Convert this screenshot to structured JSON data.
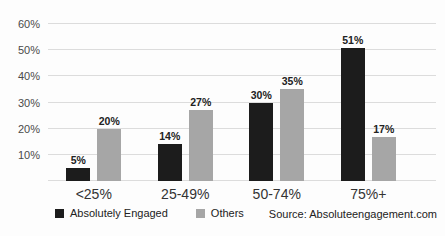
{
  "chart_data": {
    "type": "bar",
    "title": "",
    "categories": [
      "<25%",
      "25-49%",
      "50-74%",
      "75%+"
    ],
    "series": [
      {
        "name": "Absolutely Engaged",
        "color": "#1c1c1c",
        "values": [
          5,
          14,
          30,
          51
        ]
      },
      {
        "name": "Others",
        "color": "#a6a6a6",
        "values": [
          20,
          27,
          35,
          17
        ]
      }
    ],
    "value_labels": [
      [
        "5%",
        "14%",
        "30%",
        "51%"
      ],
      [
        "20%",
        "27%",
        "35%",
        "17%"
      ]
    ],
    "y_ticks": [
      10,
      20,
      30,
      40,
      50,
      60
    ],
    "y_tick_labels": [
      "10%",
      "20%",
      "30%",
      "40%",
      "50%",
      "60%"
    ],
    "ylim": [
      0,
      60
    ],
    "grid": true,
    "legend_position": "bottom-left"
  },
  "footer": {
    "source": "Source: Absoluteengagement.com"
  },
  "colors": {
    "series1": "#1c1c1c",
    "series2": "#a6a6a6",
    "gridline": "#dcdcdc",
    "background": "#fdfdfd"
  }
}
